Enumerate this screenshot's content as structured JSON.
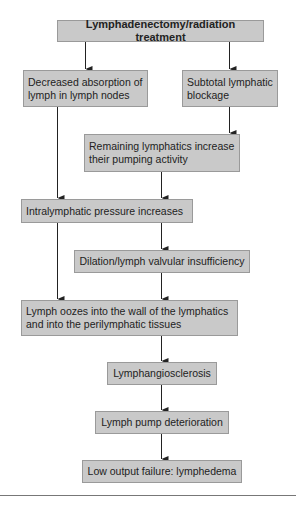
{
  "diagram": {
    "type": "flowchart",
    "colors": {
      "box_fill": "#c9c9c9",
      "box_border": "#9a9a9a",
      "arrow": "#222222"
    },
    "nodes": {
      "n1": "Lymphadenectomy/radiation treatment",
      "n2": "Decreased absorption of lymph in lymph nodes",
      "n3": "Subtotal lymphatic blockage",
      "n4": "Remaining lymphatics increase their pumping activity",
      "n5": "Intralymphatic pressure increases",
      "n6": "Dilation/lymph valvular insufficiency",
      "n7": "Lymph oozes into the wall of the lymphatics and into the perilymphatic tissues",
      "n8": "Lymphangiosclerosis",
      "n9": "Lymph pump deterioration",
      "n10": "Low output failure: lymphedema"
    },
    "edges": [
      [
        "n1",
        "n2"
      ],
      [
        "n1",
        "n3"
      ],
      [
        "n3",
        "n4"
      ],
      [
        "n2",
        "n5"
      ],
      [
        "n4",
        "n5"
      ],
      [
        "n5",
        "n6"
      ],
      [
        "n5",
        "n7"
      ],
      [
        "n6",
        "n7"
      ],
      [
        "n7",
        "n8"
      ],
      [
        "n8",
        "n9"
      ],
      [
        "n9",
        "n10"
      ]
    ]
  }
}
